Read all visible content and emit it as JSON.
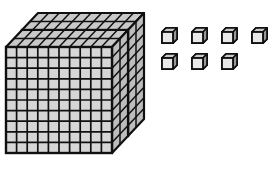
{
  "illustration": {
    "title": "Base ten blocks model",
    "description": "Two hundred-flats and seven unit cubes",
    "background_color": "#ffffff"
  },
  "palette": {
    "outline": "#101010",
    "cell_face": "#d6d6d6",
    "cell_face_light": "#e2e2e2",
    "top_face": "#c9c9c9",
    "side_face": "#bdbdbd",
    "shadow": "#2a2a2a",
    "cube_face": "#e8e8e8"
  },
  "flats": {
    "group_name": "hundred-flats",
    "count": 2,
    "rows": 10,
    "columns": 10,
    "unit_value": 100,
    "total_value": 200,
    "items": [
      {
        "label": "rear-flat",
        "value": 100,
        "x": 22,
        "y": 30
      },
      {
        "label": "front-flat",
        "value": 100,
        "x": 6,
        "y": 47
      }
    ],
    "cell": {
      "width": 10.6,
      "height": 10.6
    },
    "depth": {
      "dx": 16,
      "dy": -17
    }
  },
  "cubes": {
    "group_name": "unit-cubes",
    "count": 7,
    "unit_value": 1,
    "total_value": 7,
    "size": 15,
    "depth": 4,
    "rows": [
      {
        "label": "cube-row-top",
        "count": 4,
        "y": 28,
        "items": [
          {
            "label": "unit-cube-1",
            "x": 162
          },
          {
            "label": "unit-cube-2",
            "x": 192
          },
          {
            "label": "unit-cube-3",
            "x": 222
          },
          {
            "label": "unit-cube-4",
            "x": 252
          }
        ]
      },
      {
        "label": "cube-row-bottom",
        "count": 3,
        "y": 54,
        "items": [
          {
            "label": "unit-cube-5",
            "x": 162
          },
          {
            "label": "unit-cube-6",
            "x": 192
          },
          {
            "label": "unit-cube-7",
            "x": 222
          }
        ]
      }
    ]
  },
  "totals": {
    "hundreds": 2,
    "tens": 0,
    "ones": 7,
    "value": 207
  }
}
